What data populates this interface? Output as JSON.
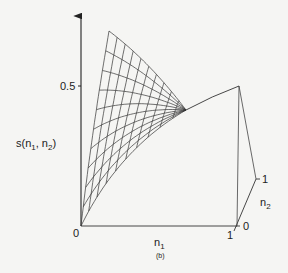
{
  "figure": {
    "caption": "(b)",
    "colors": {
      "background": "#f5f5f3",
      "ink": "#333333"
    },
    "axes": {
      "vertical": {
        "label_main": "s(n",
        "label_sub1": "1",
        "label_sep": ", n",
        "label_sub2": "2",
        "label_close": ")",
        "tick_label": "0.5"
      },
      "n1": {
        "label_main": "n",
        "label_sub": "1",
        "tick_start": "0",
        "tick_end": "1"
      },
      "n2": {
        "label_main": "n",
        "label_sub": "2",
        "tick_start": "0",
        "tick_end": "1"
      }
    }
  },
  "chart_data": {
    "type": "surface-wireframe",
    "title": "",
    "zlabel": "s(n1, n2)",
    "xlabel": "n1",
    "ylabel": "n2",
    "ticks": {
      "z": [
        "0.5"
      ],
      "n1": [
        "0",
        "1"
      ],
      "n2": [
        "0",
        "1"
      ]
    },
    "grid_lines_per_direction": 10
  }
}
